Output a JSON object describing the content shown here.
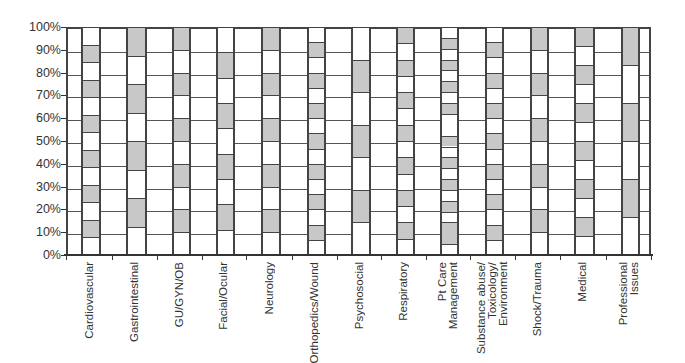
{
  "chart_data": {
    "type": "bar",
    "subtype": "stacked-100-percent",
    "title": "",
    "xlabel": "",
    "ylabel": "",
    "ylim": [
      0,
      100
    ],
    "yticks": [
      "0%",
      "10%",
      "20%",
      "30%",
      "40%",
      "50%",
      "60%",
      "70%",
      "80%",
      "90%",
      "100%"
    ],
    "grid": true,
    "legend": null,
    "colors": {
      "filled": "#c8c8c8",
      "empty": "#ffffff",
      "lines": "#444444"
    },
    "categories": [
      "Cardiovascular",
      "Gastrointestinal",
      "GU/GYN/OB",
      "Facial/Ocular",
      "Neurology",
      "Orthopedics/Wound",
      "Psychosocial",
      "Respiratory",
      "Pt Care Management",
      "Substance abuse/ Toxicology/ Environment",
      "Shock/Trauma",
      "Medical",
      "Professional Issues"
    ],
    "series_description": "Each bar is divided into equal alternating white/grey segments (bottom segment white); values are the segment boundaries in %",
    "bars": [
      {
        "category": "Cardiovascular",
        "segments": 13,
        "segment_pct": 7.7,
        "top_color": "white",
        "boundaries": [
          0,
          7.7,
          15.4,
          23.1,
          30.8,
          38.5,
          46.2,
          53.8,
          61.5,
          69.2,
          76.9,
          84.6,
          92.3,
          100
        ]
      },
      {
        "category": "Gastrointestinal",
        "segments": 8,
        "segment_pct": 12.5,
        "top_color": "grey",
        "boundaries": [
          0,
          12.5,
          25,
          37.5,
          50,
          62.5,
          75,
          87.5,
          100
        ]
      },
      {
        "category": "GU/GYN/OB",
        "segments": 10,
        "segment_pct": 10,
        "top_color": "grey",
        "boundaries": [
          0,
          10,
          20,
          30,
          40,
          50,
          60,
          70,
          80,
          90,
          100
        ]
      },
      {
        "category": "Facial/Ocular",
        "segments": 9,
        "segment_pct": 11.1,
        "top_color": "white",
        "boundaries": [
          0,
          11.1,
          22.2,
          33.3,
          44.4,
          55.6,
          66.7,
          77.8,
          88.9,
          100
        ]
      },
      {
        "category": "Neurology",
        "segments": 10,
        "segment_pct": 10,
        "top_color": "grey",
        "boundaries": [
          0,
          10,
          20,
          30,
          40,
          50,
          60,
          70,
          80,
          90,
          100
        ]
      },
      {
        "category": "Orthopedics/Wound",
        "segments": 15,
        "segment_pct": 6.7,
        "top_color": "white",
        "boundaries": [
          0,
          6.7,
          13.3,
          20,
          26.7,
          33.3,
          40,
          46.7,
          53.3,
          60,
          66.7,
          73.3,
          80,
          86.7,
          93.3,
          100
        ]
      },
      {
        "category": "Psychosocial",
        "segments": 7,
        "segment_pct": 14.3,
        "top_color": "white",
        "boundaries": [
          0,
          14.3,
          28.6,
          42.9,
          57.1,
          71.4,
          85.7,
          100
        ]
      },
      {
        "category": "Respiratory",
        "segments": 14,
        "segment_pct": 7.1,
        "top_color": "grey",
        "boundaries": [
          0,
          7.1,
          14.3,
          21.4,
          28.6,
          35.7,
          42.9,
          50,
          57.1,
          64.3,
          71.4,
          78.6,
          85.7,
          92.9,
          100
        ]
      },
      {
        "category": "Pt Care Management",
        "segments": 19,
        "segment_pct": null,
        "top_color": "white",
        "boundaries": [
          0,
          4.8,
          14.3,
          19,
          23.8,
          28.6,
          33.3,
          38.1,
          42.9,
          47.6,
          52.4,
          61.9,
          66.7,
          71.4,
          76.2,
          81,
          85.7,
          90.5,
          95.2,
          100
        ]
      },
      {
        "category": "Substance abuse/ Toxicology/ Environment",
        "segments": 15,
        "segment_pct": 6.7,
        "top_color": "white",
        "boundaries": [
          0,
          6.7,
          13.3,
          20,
          26.7,
          33.3,
          40,
          46.7,
          53.3,
          60,
          66.7,
          73.3,
          80,
          86.7,
          93.3,
          100
        ]
      },
      {
        "category": "Shock/Trauma",
        "segments": 10,
        "segment_pct": 10,
        "top_color": "grey",
        "boundaries": [
          0,
          10,
          20,
          30,
          40,
          50,
          60,
          70,
          80,
          90,
          100
        ]
      },
      {
        "category": "Medical",
        "segments": 12,
        "segment_pct": 8.3,
        "top_color": "grey",
        "boundaries": [
          0,
          8.3,
          16.7,
          25,
          33.3,
          41.7,
          50,
          58.3,
          66.7,
          75,
          83.3,
          91.7,
          100
        ]
      },
      {
        "category": "Professional Issues",
        "segments": 6,
        "segment_pct": 16.7,
        "top_color": "grey",
        "boundaries": [
          0,
          16.7,
          33.3,
          50,
          66.7,
          83.3,
          100
        ]
      }
    ],
    "values": [
      13,
      8,
      10,
      9,
      10,
      15,
      7,
      14,
      19,
      15,
      10,
      12,
      6
    ]
  },
  "axis": {
    "y_labels": [
      "0%",
      "10%",
      "20%",
      "30%",
      "40%",
      "50%",
      "60%",
      "70%",
      "80%",
      "90%",
      "100%"
    ],
    "x_labels": [
      "Cardiovascular",
      "Gastrointestinal",
      "GU/GYN/OB",
      "Facial/Ocular",
      "Neurology",
      "Orthopedics/Wound",
      "Psychosocial",
      "Respiratory",
      "Pt Care\nManagement",
      "Substance abuse/\nToxicology/\nEnvironment",
      "Shock/Trauma",
      "Medical",
      "Professional\nIssues"
    ]
  }
}
